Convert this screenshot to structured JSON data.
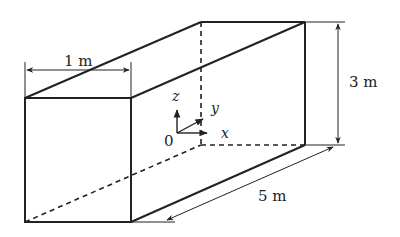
{
  "diagram": {
    "type": "rectangular-box-3d",
    "dimensions": {
      "width_label": "1 m",
      "height_label": "3 m",
      "length_label": "5 m"
    },
    "axes": {
      "origin_label": "0",
      "x_label": "x",
      "y_label": "y",
      "z_label": "z"
    },
    "colors": {
      "line": "#222222",
      "background": "#ffffff"
    }
  }
}
